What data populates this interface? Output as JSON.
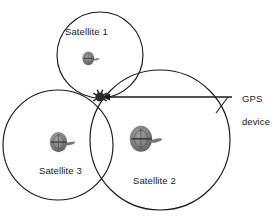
{
  "figure": {
    "type": "gps-trilateration-diagram",
    "background_color": "#ffffff",
    "line_color": "#1a1a1a",
    "dot_color": "#2b2b2b",
    "satellite_icon_color": "#6e6e6e"
  },
  "coverage_circles": [
    {
      "id": "satellite-1",
      "label": "Satellite 1",
      "label_x": 65,
      "label_y": 26,
      "center_x": 100,
      "center_y": 55,
      "radius": 43,
      "icon_x": 83,
      "icon_y": 53,
      "icon_scale": 0.62,
      "icon_name": "satellite-icon"
    },
    {
      "id": "satellite-2",
      "label": "Satellite 2",
      "label_x": 133,
      "label_y": 175,
      "center_x": 160,
      "center_y": 140,
      "radius": 70,
      "icon_x": 152,
      "icon_y": 143,
      "icon_scale": 1.18,
      "icon_name": "satellite-icon"
    },
    {
      "id": "satellite-3",
      "label": "Satellite 3",
      "label_x": 39,
      "label_y": 165,
      "center_x": 58,
      "center_y": 145,
      "radius": 55,
      "icon_x": 62,
      "icon_y": 142,
      "icon_scale": 0.92,
      "icon_name": "satellite-icon"
    }
  ],
  "intersection": {
    "name": "gps-device-point",
    "x": 100,
    "y": 97,
    "radius": 4.6
  },
  "callout": {
    "label_line_1": "GPS",
    "label_line_2": "device",
    "label_x": 231,
    "label_y": 81,
    "arrow_start_x": 232,
    "arrow_start_y": 97,
    "arrow_end_x": 105,
    "arrow_end_y": 97,
    "leader_x1": 216,
    "leader_y1": 113,
    "leader_x2": 228,
    "leader_y2": 97
  }
}
